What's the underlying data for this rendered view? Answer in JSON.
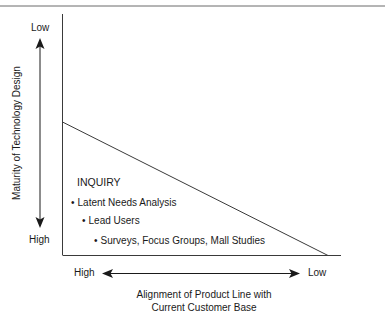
{
  "diagram": {
    "y_axis": {
      "label": "Maturity of Technology Design",
      "top_label": "Low",
      "bottom_label": "High"
    },
    "x_axis": {
      "label_line1": "Alignment of Product Line with",
      "label_line2": "Current Customer Base",
      "left_label": "High",
      "right_label": "Low"
    },
    "region": {
      "title": "INQUIRY",
      "items": [
        "Latent Needs Analysis",
        "Lead Users",
        "Surveys, Focus Groups, Mall Studies"
      ]
    },
    "colors": {
      "line": "#3a3a3a",
      "text": "#1a1a1a",
      "background": "#ffffff"
    }
  }
}
